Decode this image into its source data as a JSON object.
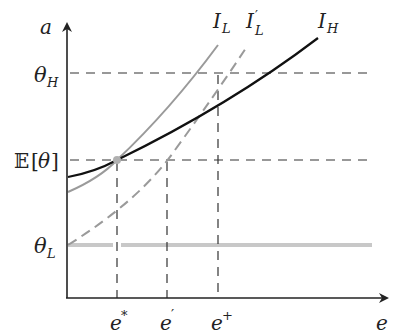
{
  "diagram": {
    "axes": {
      "y_label": "a",
      "x_label": "e"
    },
    "y_ticks": [
      {
        "id": "theta_h",
        "symbol": "θ",
        "sub": "H"
      },
      {
        "id": "expected_theta",
        "prefix": "𝔼",
        "open": "[",
        "symbol": "θ",
        "close": "]"
      },
      {
        "id": "theta_l",
        "symbol": "θ",
        "sub": "L"
      }
    ],
    "x_ticks": [
      {
        "id": "e_star",
        "base": "e",
        "sup": "*"
      },
      {
        "id": "e_prime",
        "base": "e",
        "sup": "′"
      },
      {
        "id": "e_plus",
        "base": "e",
        "sup": "+"
      }
    ],
    "curves": [
      {
        "id": "I_L",
        "base": "I",
        "sub": "L",
        "sup": "",
        "style": "solid",
        "color": "#9a9a9a"
      },
      {
        "id": "I_L_prime",
        "base": "I",
        "sub": "L",
        "sup": "′",
        "style": "dashed",
        "color": "#9a9a9a"
      },
      {
        "id": "I_H",
        "base": "I",
        "sub": "H",
        "sup": "",
        "style": "solid",
        "color": "#111111"
      }
    ],
    "colors": {
      "axis": "#222222",
      "dash_guides": "#333333",
      "theta_l_line": "#c8c8c8",
      "intersection_dot": "#b0b0b0"
    }
  }
}
